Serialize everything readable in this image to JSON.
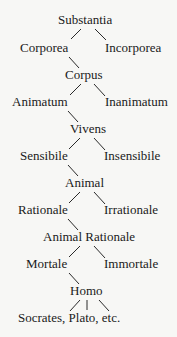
{
  "diagram": {
    "nodes": {
      "substantia": "Substantia",
      "corporea": "Corporea",
      "incorporea": "Incorporea",
      "corpus": "Corpus",
      "animatum": "Animatum",
      "inanimatum": "Inanimatum",
      "vivens": "Vivens",
      "sensibile": "Sensibile",
      "insensibile": "Insensibile",
      "animal": "Animal",
      "rationale": "Rationale",
      "irrationale": "Irrationale",
      "animal_rationale": "Animal Rationale",
      "mortale": "Mortale",
      "immortale": "Immortale",
      "homo": "Homo",
      "individuals": "Socrates, Plato, etc."
    },
    "colors": {
      "background": "#f7f7f5",
      "text": "#1a1a1a"
    }
  }
}
